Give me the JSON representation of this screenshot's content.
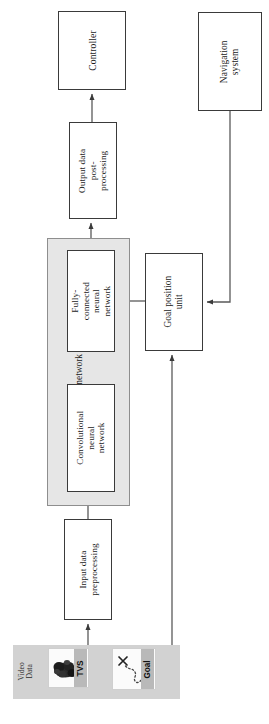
{
  "diagram": {
    "orientation": "rotated-90",
    "blocks": [
      {
        "id": "controller",
        "label": "Controller"
      },
      {
        "id": "navigation",
        "label": "Navigation system"
      },
      {
        "id": "output",
        "label": "Output data post-\nprocessing"
      },
      {
        "id": "goal_unit",
        "label": "Goal position unit"
      },
      {
        "id": "fcnn",
        "label": "Fully-connected neural\nnetwork"
      },
      {
        "id": "cnn",
        "label": "Convolutional neural\nnetwork"
      },
      {
        "id": "input",
        "label": "Input data\npreprocessing"
      }
    ],
    "group": {
      "id": "neural_network_algorithms",
      "label": "Neural network algorithms",
      "fill": "#e6e6e6",
      "members": [
        "fcnn",
        "cnn"
      ]
    },
    "video_strip": {
      "label": "Video\nData",
      "fill": "#d2d2d2",
      "thumbnails": [
        {
          "id": "tvs",
          "caption": "TVS",
          "content": "dark-object-photo"
        },
        {
          "id": "goal",
          "caption": "Goal",
          "content": "x-marker-with-dotted-path"
        }
      ]
    },
    "connections": [
      {
        "from": "video_strip.tvs",
        "to": "input",
        "arrow": "single"
      },
      {
        "from": "input",
        "to": "cnn",
        "arrow": "single"
      },
      {
        "from": "cnn",
        "to": "fcnn",
        "arrow": "single"
      },
      {
        "from": "fcnn",
        "to": "output",
        "arrow": "single"
      },
      {
        "from": "output",
        "to": "controller",
        "arrow": "single"
      },
      {
        "from": "goal_unit",
        "to": "fcnn",
        "arrow": "single"
      },
      {
        "from": "navigation",
        "to": "goal_unit",
        "arrow": "single"
      },
      {
        "from": "video_strip.goal",
        "to": "goal_unit",
        "arrow": "single"
      }
    ],
    "style": {
      "line_color": "#5a5a5a",
      "box_border": "#3a3a3a",
      "box_fill": "#ffffff",
      "background": "#ffffff"
    }
  }
}
